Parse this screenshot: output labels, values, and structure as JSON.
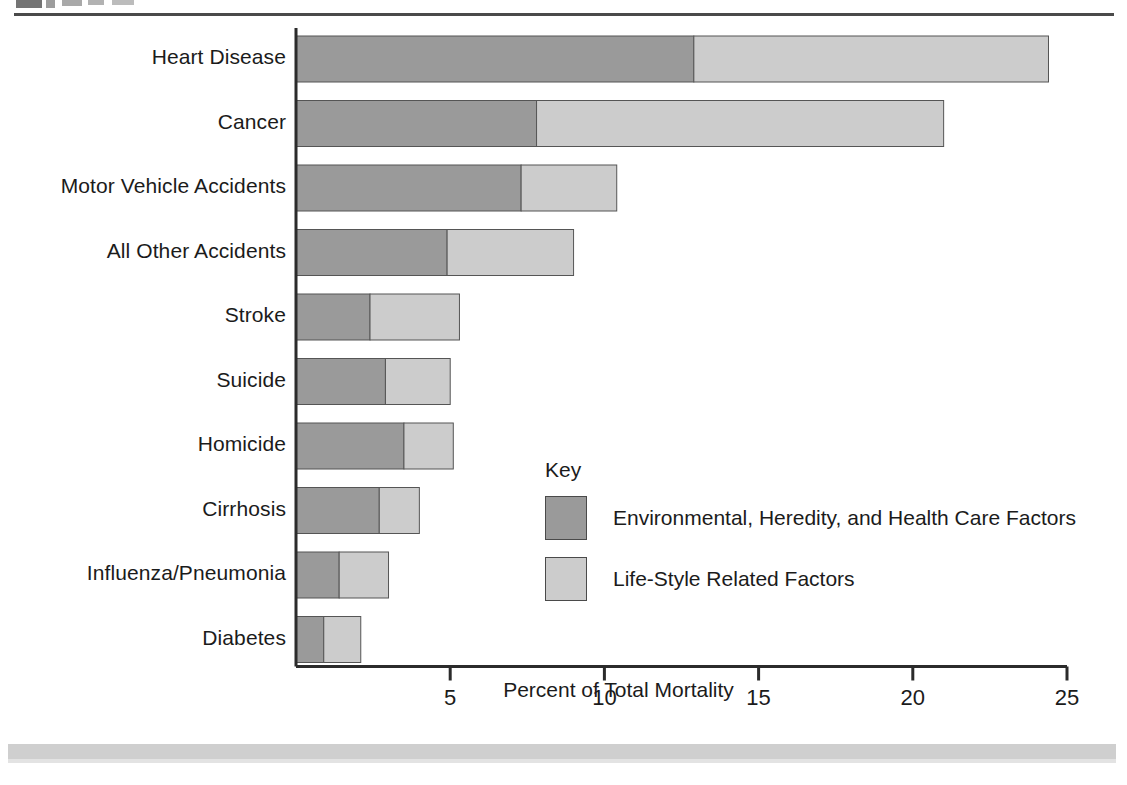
{
  "page": {
    "top_rule": "horizontal-rule",
    "footer_band": "gray-footer-band"
  },
  "chart_data": {
    "type": "bar",
    "orientation": "horizontal",
    "stacked": true,
    "title": "",
    "xlabel": "Percent of Total Mortality",
    "ylabel": "",
    "xlim": [
      0,
      25
    ],
    "xticks": [
      5,
      10,
      15,
      20,
      25
    ],
    "grid": false,
    "legend_position": "inside-right",
    "legend_title": "Key",
    "categories": [
      "Heart Disease",
      "Cancer",
      "Motor Vehicle Accidents",
      "All Other Accidents",
      "Stroke",
      "Suicide",
      "Homicide",
      "Cirrhosis",
      "Influenza/Pneumonia",
      "Diabetes"
    ],
    "series": [
      {
        "name": "Environmental, Heredity, and Health Care Factors",
        "color": "#9a9a9a",
        "values": [
          12.9,
          7.8,
          7.3,
          4.9,
          2.4,
          2.9,
          3.5,
          2.7,
          1.4,
          0.9
        ]
      },
      {
        "name": "Life-Style Related Factors",
        "color": "#cccccc",
        "values": [
          11.5,
          13.2,
          3.1,
          4.1,
          2.9,
          2.1,
          1.6,
          1.3,
          1.6,
          1.2
        ]
      }
    ],
    "totals": [
      24.4,
      21.0,
      10.4,
      9.0,
      5.3,
      5.0,
      5.1,
      4.0,
      3.0,
      2.1
    ]
  },
  "legend": {
    "title": "Key",
    "items": [
      {
        "label": "Environmental, Heredity, and Health Care Factors",
        "color": "#9a9a9a"
      },
      {
        "label": "Life-Style Related Factors",
        "color": "#cccccc"
      }
    ]
  },
  "axis": {
    "x_title": "Percent of Total Mortality",
    "tick_labels": [
      "5",
      "10",
      "15",
      "20",
      "25"
    ]
  },
  "colors": {
    "dark_segment": "#9a9a9a",
    "light_segment": "#cccccc",
    "segment_border": "#555555",
    "axis_line": "#2b2b2b",
    "text": "#1b1b1b"
  }
}
